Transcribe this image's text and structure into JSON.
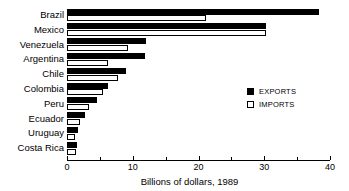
{
  "chart_data": {
    "type": "bar",
    "orientation": "horizontal",
    "title": "",
    "xlabel": "Billions of dollars, 1989",
    "ylabel": "",
    "xlim": [
      0,
      40
    ],
    "xticks": [
      0,
      10,
      20,
      30,
      40
    ],
    "xtick_labels": [
      "0",
      "10",
      "20",
      "30",
      "40"
    ],
    "xticks_minor": [
      5,
      15,
      25,
      35
    ],
    "grid": false,
    "legend_position": "right-middle",
    "categories": [
      "Brazil",
      "Mexico",
      "Venezuela",
      "Argentina",
      "Chile",
      "Colombia",
      "Peru",
      "Ecuador",
      "Uruguay",
      "Costa Rica"
    ],
    "series": [
      {
        "name": "EXPORTS",
        "color": "#000000",
        "values": [
          38.3,
          30.2,
          12.0,
          11.9,
          8.9,
          6.2,
          4.6,
          2.8,
          1.6,
          1.5
        ]
      },
      {
        "name": "IMPORTS",
        "color": "#ffffff",
        "values": [
          21.2,
          30.3,
          9.3,
          6.2,
          7.7,
          5.5,
          3.3,
          2.0,
          1.2,
          1.4
        ]
      }
    ]
  },
  "legend": {
    "entries": [
      {
        "label": "EXPORTS",
        "swatch": "filled-square-icon"
      },
      {
        "label": "IMPORTS",
        "swatch": "hollow-square-icon"
      }
    ]
  }
}
